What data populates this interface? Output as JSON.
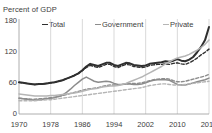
{
  "chart_data": {
    "type": "line",
    "title": "Percent of GDP",
    "xlabel": "",
    "ylabel": "Percent of GDP",
    "xlim": [
      1970,
      2018
    ],
    "ylim": [
      0,
      180
    ],
    "yticks": [
      0,
      60,
      120,
      180
    ],
    "xticks": [
      1970,
      1978,
      1986,
      1994,
      2002,
      2010,
      2018
    ],
    "grid": "vertical",
    "legend_position": "top",
    "legend": [
      "Total",
      "Government",
      "Private"
    ],
    "colors": {
      "total": "#2f2f2f",
      "government": "#8c8c8c",
      "private": "#b5b5b5",
      "gridline": "#c9c9c9",
      "axis": "#9a9a9a",
      "text": "#3d3d3d"
    },
    "x": [
      1970,
      1971,
      1972,
      1973,
      1974,
      1975,
      1976,
      1977,
      1978,
      1979,
      1980,
      1981,
      1982,
      1983,
      1984,
      1985,
      1986,
      1987,
      1988,
      1989,
      1990,
      1991,
      1992,
      1993,
      1994,
      1995,
      1996,
      1997,
      1998,
      1999,
      2000,
      2001,
      2002,
      2003,
      2004,
      2005,
      2006,
      2007,
      2008,
      2009,
      2010,
      2011,
      2012,
      2013,
      2014,
      2015,
      2016,
      2017,
      2018
    ],
    "series": [
      {
        "name": "Total",
        "style": "solid",
        "color": "#2f2f2f",
        "values": [
          60,
          59,
          58,
          57,
          56,
          57,
          57,
          58,
          59,
          60,
          62,
          64,
          67,
          70,
          73,
          77,
          83,
          90,
          95,
          93,
          91,
          94,
          97,
          97,
          93,
          91,
          94,
          97,
          96,
          93,
          92,
          91,
          92,
          95,
          96,
          97,
          98,
          100,
          99,
          101,
          104,
          101,
          100,
          103,
          108,
          117,
          127,
          140,
          165
        ]
      },
      {
        "name": "Total (alt)",
        "style": "dashed",
        "color": "#2f2f2f",
        "values": [
          60,
          59,
          58,
          57,
          56,
          57,
          57,
          58,
          59,
          60,
          62,
          64,
          67,
          70,
          73,
          77,
          82,
          88,
          92,
          90,
          88,
          91,
          94,
          94,
          90,
          88,
          91,
          94,
          93,
          90,
          89,
          88,
          89,
          92,
          93,
          94,
          94,
          95,
          94,
          96,
          97,
          95,
          94,
          97,
          101,
          106,
          112,
          117,
          123
        ]
      },
      {
        "name": "Government",
        "style": "solid",
        "color": "#8c8c8c",
        "values": [
          30,
          29,
          28,
          27,
          26,
          27,
          28,
          29,
          30,
          31,
          33,
          36,
          41,
          47,
          54,
          60,
          66,
          70,
          66,
          62,
          60,
          61,
          62,
          61,
          58,
          56,
          56,
          57,
          57,
          56,
          56,
          57,
          59,
          62,
          64,
          65,
          65,
          65,
          64,
          60,
          56,
          55,
          55,
          57,
          59,
          61,
          63,
          65,
          68
        ]
      },
      {
        "name": "Government (alt)",
        "style": "dashed",
        "color": "#8c8c8c",
        "values": [
          30,
          29,
          29,
          28,
          28,
          29,
          29,
          30,
          31,
          32,
          33,
          35,
          37,
          39,
          41,
          43,
          45,
          47,
          48,
          49,
          50,
          52,
          54,
          55,
          55,
          55,
          56,
          57,
          58,
          58,
          58,
          59,
          61,
          63,
          65,
          66,
          67,
          67,
          66,
          63,
          61,
          61,
          62,
          64,
          66,
          68,
          70,
          72,
          75
        ]
      },
      {
        "name": "Private",
        "style": "solid",
        "color": "#b5b5b5",
        "values": [
          38,
          37,
          36,
          35,
          34,
          34,
          34,
          34,
          35,
          35,
          36,
          37,
          38,
          39,
          40,
          41,
          43,
          45,
          47,
          48,
          49,
          51,
          52,
          53,
          53,
          54,
          56,
          58,
          61,
          64,
          67,
          70,
          74,
          78,
          82,
          86,
          90,
          95,
          99,
          103,
          106,
          108,
          110,
          113,
          117,
          121,
          126,
          132,
          140
        ]
      },
      {
        "name": "Private (alt)",
        "style": "dashed",
        "color": "#b5b5b5",
        "values": [
          25,
          25,
          25,
          25,
          25,
          26,
          26,
          27,
          27,
          28,
          29,
          30,
          31,
          32,
          33,
          34,
          35,
          36,
          37,
          38,
          39,
          40,
          41,
          42,
          43,
          44,
          45,
          46,
          47,
          48,
          49,
          50,
          52,
          54,
          55,
          56,
          57,
          57,
          56,
          55,
          55,
          55,
          56,
          57,
          58,
          59,
          60,
          61,
          62
        ]
      }
    ]
  }
}
